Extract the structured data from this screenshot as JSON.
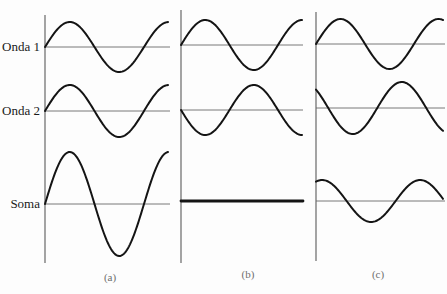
{
  "rows": {
    "wave1_label": "Onda 1",
    "wave2_label": "Onda 2",
    "sum_label": "Soma"
  },
  "panels": [
    {
      "label": "(a)",
      "description": "constructive interference — waves in phase",
      "axis": {
        "x": 45,
        "top": 15,
        "bottom": 263
      },
      "line_end": 170,
      "waves": [
        {
          "name": "Onda 1",
          "baseline": 47,
          "amplitude": 25,
          "phase_deg": 0,
          "period_px": 99,
          "x_end": 168
        },
        {
          "name": "Onda 2",
          "baseline": 111,
          "amplitude": 26,
          "phase_deg": 0,
          "period_px": 99,
          "x_end": 168
        },
        {
          "name": "Soma",
          "baseline": 204,
          "amplitude": 52,
          "phase_deg": 0,
          "period_px": 99,
          "x_end": 168
        }
      ]
    },
    {
      "label": "(b)",
      "description": "destructive interference — waves 180° out of phase",
      "axis": {
        "x": 181,
        "top": 10,
        "bottom": 263
      },
      "line_end": 303,
      "waves": [
        {
          "name": "Onda 1",
          "baseline": 45,
          "amplitude": 25,
          "phase_deg": 0,
          "period_px": 97,
          "x_end": 302
        },
        {
          "name": "Onda 2",
          "baseline": 110,
          "amplitude": 25,
          "phase_deg": 180,
          "period_px": 97,
          "x_end": 302
        },
        {
          "name": "Soma",
          "baseline": 201,
          "amplitude": 0,
          "phase_deg": 0,
          "period_px": 97,
          "x_end": 303
        }
      ]
    },
    {
      "label": "(c)",
      "description": "partial interference — waves out of phase by ~135°",
      "axis": {
        "x": 316,
        "top": 12,
        "bottom": 261
      },
      "line_end": 445,
      "waves": [
        {
          "name": "Onda 1",
          "baseline": 44,
          "amplitude": 25,
          "phase_deg": 0,
          "period_px": 98,
          "x_end": 443
        },
        {
          "name": "Onda 2",
          "baseline": 108,
          "amplitude": 26,
          "phase_deg": 135,
          "period_px": 98,
          "x_end": 443
        },
        {
          "name": "Soma",
          "baseline": 201,
          "amplitude": 21,
          "phase_deg": 67.5,
          "period_px": 98,
          "x_end": 443
        }
      ]
    }
  ],
  "colors": {
    "wave": "#141414",
    "axis": "#5a5a5a",
    "background": "#fdfdfd"
  }
}
